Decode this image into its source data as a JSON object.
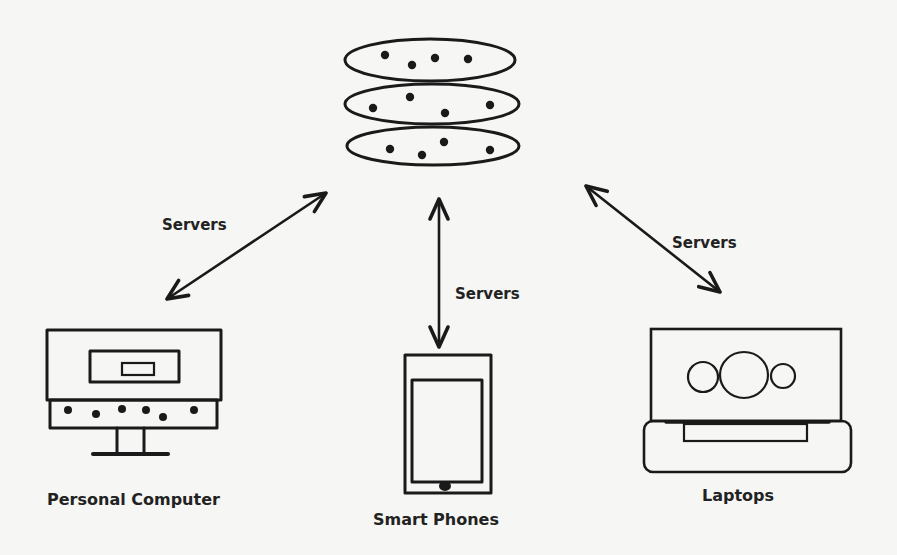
{
  "diagram": {
    "type": "network-client-server",
    "background": "#f6f6f4",
    "ink_color": "#1a1a1a",
    "server": {
      "name": "Server Stack",
      "disks": [
        {
          "cx": 430,
          "cy": 60,
          "rx": 85,
          "ry": 21,
          "dots": [
            [
              385,
              55
            ],
            [
              412,
              65
            ],
            [
              435,
              58
            ],
            [
              468,
              59
            ]
          ]
        },
        {
          "cx": 432,
          "cy": 104,
          "rx": 87,
          "ry": 20,
          "dots": [
            [
              373,
              108
            ],
            [
              410,
              97
            ],
            [
              445,
              113
            ],
            [
              490,
              105
            ]
          ]
        },
        {
          "cx": 433,
          "cy": 146,
          "rx": 86,
          "ry": 19,
          "dots": [
            [
              390,
              149
            ],
            [
              422,
              155
            ],
            [
              444,
              142
            ],
            [
              490,
              150
            ]
          ]
        }
      ]
    },
    "connections": [
      {
        "id": "left",
        "label": "Servers",
        "from": [
          326,
          193
        ],
        "to": [
          167,
          299
        ],
        "label_pos": [
          162,
          218
        ]
      },
      {
        "id": "center",
        "label": "Servers",
        "from": [
          439,
          199
        ],
        "to": [
          439,
          347
        ],
        "label_pos": [
          455,
          287
        ]
      },
      {
        "id": "right",
        "label": "Servers",
        "from": [
          586,
          186
        ],
        "to": [
          720,
          292
        ],
        "label_pos": [
          672,
          236
        ]
      }
    ],
    "devices": {
      "personal_computer": {
        "label": "Personal Computer",
        "label_pos": [
          47,
          492
        ],
        "panel_dots": [
          [
            68,
            410
          ],
          [
            96,
            414
          ],
          [
            122,
            409
          ],
          [
            146,
            410
          ],
          [
            163,
            417
          ],
          [
            194,
            410
          ]
        ]
      },
      "smart_phone": {
        "label": "Smart Phones",
        "label_pos": [
          373,
          512
        ]
      },
      "laptop": {
        "label": "Laptops",
        "label_pos": [
          702,
          488
        ]
      }
    }
  }
}
